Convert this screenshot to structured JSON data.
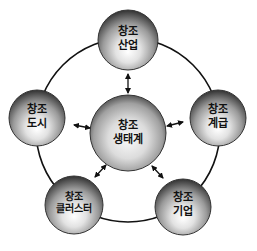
{
  "diagram": {
    "center": {
      "line1": "창조",
      "line2": "생태계"
    },
    "nodes": [
      {
        "id": "industry",
        "line1": "창조",
        "line2": "산업"
      },
      {
        "id": "class",
        "line1": "창조",
        "line2": "계급"
      },
      {
        "id": "enterprise",
        "line1": "창조",
        "line2": "기업"
      },
      {
        "id": "cluster",
        "line1": "창조",
        "line2": "클러스터"
      },
      {
        "id": "city",
        "line1": "창조",
        "line2": "도시"
      }
    ],
    "connections": [
      {
        "from": "center",
        "to": "industry",
        "type": "bidirectional-arrow"
      },
      {
        "from": "center",
        "to": "class",
        "type": "bidirectional-arrow"
      },
      {
        "from": "center",
        "to": "enterprise",
        "type": "bidirectional-arrow"
      },
      {
        "from": "center",
        "to": "cluster",
        "type": "bidirectional-arrow"
      },
      {
        "from": "center",
        "to": "city",
        "type": "bidirectional-arrow"
      }
    ],
    "outer_ring": "connects all outer nodes in a circle",
    "colors": {
      "sphere_light": "#f4f4f4",
      "sphere_dark": "#3a3a3a",
      "line": "#111111",
      "background": "#ffffff"
    }
  }
}
